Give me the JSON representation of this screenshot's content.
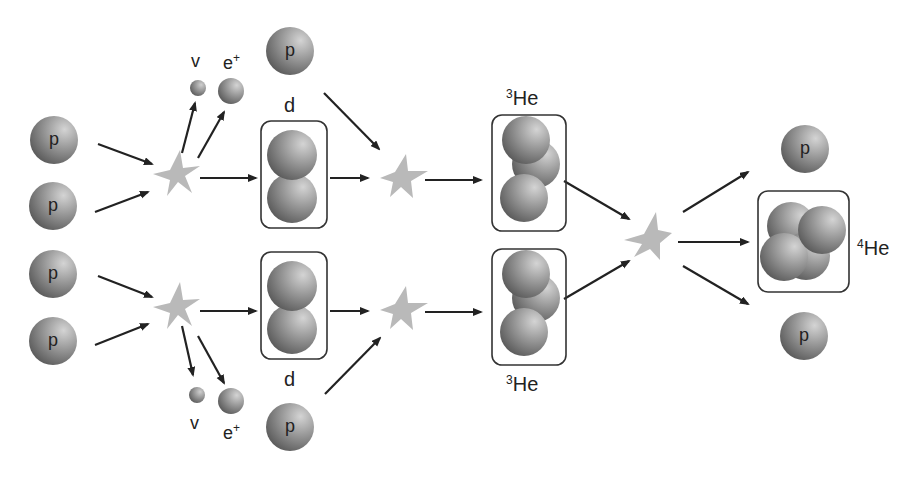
{
  "diagram": {
    "colors": {
      "particle_light": "#c8c8c8",
      "particle_dark": "#5a5a5a",
      "star": "#b8b8b8",
      "arrow": "#222222",
      "box_border": "#333333",
      "background": "#ffffff"
    },
    "labels": {
      "proton": "p",
      "deuteron": "d",
      "neutrino": "v",
      "positron": "e",
      "positron_sup": "+",
      "he3_sup": "3",
      "he3": "He",
      "he4_sup": "4",
      "he4": "He"
    },
    "stages": [
      {
        "name": "step-1-top",
        "inputs": [
          "p",
          "p"
        ],
        "outputs": [
          "d",
          "v",
          "e+"
        ]
      },
      {
        "name": "step-1-bottom",
        "inputs": [
          "p",
          "p"
        ],
        "outputs": [
          "d",
          "v",
          "e+"
        ]
      },
      {
        "name": "step-2-top",
        "inputs": [
          "d",
          "p"
        ],
        "outputs": [
          "3He"
        ]
      },
      {
        "name": "step-2-bottom",
        "inputs": [
          "d",
          "p"
        ],
        "outputs": [
          "3He"
        ]
      },
      {
        "name": "step-3",
        "inputs": [
          "3He",
          "3He"
        ],
        "outputs": [
          "p",
          "4He",
          "p"
        ]
      }
    ]
  }
}
